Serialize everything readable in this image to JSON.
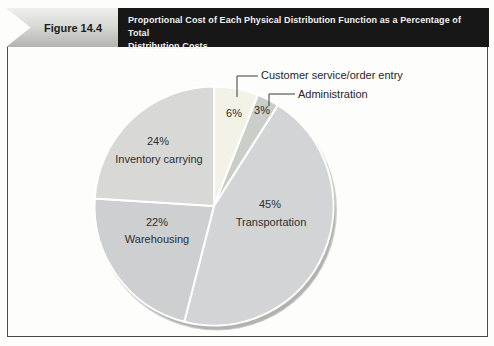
{
  "figure": {
    "label": "Figure 14.4",
    "title_line1": "Proportional Cost of Each Physical Distribution Function as a Percentage of Total",
    "title_line2": "Distribution Costs"
  },
  "chart_data": {
    "type": "pie",
    "title": "Proportional Cost of Each Physical Distribution Function as a Percentage of Total Distribution Costs",
    "start_angle_deg": 0,
    "direction": "clockwise",
    "legend_position": "none",
    "labels_on_slices": true,
    "separator_color": "#ffffff",
    "slices": [
      {
        "id": "customer-service",
        "label": "Customer service/order entry",
        "value": 6,
        "pct_label": "6%",
        "color": "#f3f2e6",
        "callout": true
      },
      {
        "id": "administration",
        "label": "Administration",
        "value": 3,
        "pct_label": "3%",
        "color": "#c9cec8",
        "callout": true
      },
      {
        "id": "transportation",
        "label": "Transportation",
        "value": 45,
        "pct_label": "45%",
        "color": "#d2d4d5",
        "callout": false
      },
      {
        "id": "warehousing",
        "label": "Warehousing",
        "value": 22,
        "pct_label": "22%",
        "color": "#cdcfd0",
        "callout": false
      },
      {
        "id": "inventory-carrying",
        "label": "Inventory carrying",
        "value": 24,
        "pct_label": "24%",
        "color": "#d8d9d6",
        "callout": false
      }
    ]
  }
}
